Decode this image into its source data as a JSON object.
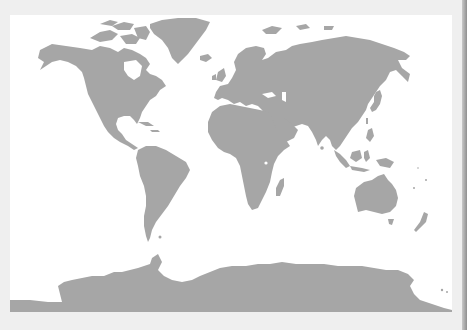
{
  "document": {
    "type": "scanned-page",
    "top_text": "",
    "bottom_text": ""
  },
  "map": {
    "projection": "world",
    "background_color": "#ffffff",
    "land_color": "#a6a6a6",
    "page_color": "#eeeeee",
    "regions": [
      {
        "name": "North America"
      },
      {
        "name": "Greenland"
      },
      {
        "name": "South America"
      },
      {
        "name": "Europe"
      },
      {
        "name": "Asia"
      },
      {
        "name": "Africa"
      },
      {
        "name": "Madagascar"
      },
      {
        "name": "Arabian Peninsula"
      },
      {
        "name": "Indonesia"
      },
      {
        "name": "Japan"
      },
      {
        "name": "Australia"
      },
      {
        "name": "Tasmania"
      },
      {
        "name": "New Zealand"
      },
      {
        "name": "British Isles"
      },
      {
        "name": "Iceland"
      },
      {
        "name": "Antarctica"
      }
    ]
  }
}
